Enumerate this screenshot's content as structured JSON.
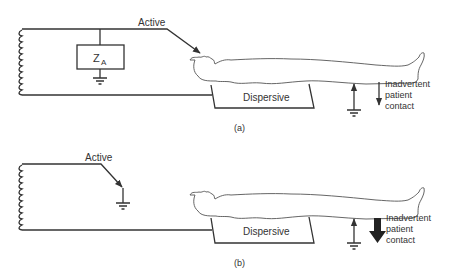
{
  "figure": {
    "panels": [
      {
        "id": "a",
        "caption": "(a)",
        "active_label": "Active",
        "impedance_label": "Z",
        "impedance_subscript": "A",
        "pad_label": "Dispersive",
        "contact_label": [
          "Inadvertent",
          "patient",
          "contact"
        ],
        "contact_arrow": "thin"
      },
      {
        "id": "b",
        "caption": "(b)",
        "active_label": "Active",
        "pad_label": "Dispersive",
        "contact_label": [
          "Inadvertent",
          "patient",
          "contact"
        ],
        "contact_arrow": "bold"
      }
    ]
  },
  "colors": {
    "line": "#333333",
    "text": "#333333",
    "background": "#ffffff"
  }
}
